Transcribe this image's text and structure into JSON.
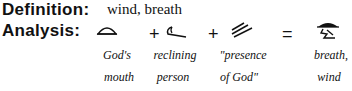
{
  "definition": {
    "label": "Definition:",
    "value": "wind, breath"
  },
  "analysis": {
    "label": "Analysis:",
    "operators": [
      "+",
      "+",
      "="
    ],
    "glyphs": [
      {
        "icon": "mouth-glyph-icon",
        "caption1": "God's",
        "caption2": "mouth"
      },
      {
        "icon": "reclining-person-glyph-icon",
        "caption1": "reclining",
        "caption2": "person"
      },
      {
        "icon": "triple-lines-glyph-icon",
        "caption1": "\"presence",
        "caption2": "of God\""
      },
      {
        "icon": "breath-wind-glyph-icon",
        "caption1": "breath,",
        "caption2": "wind"
      }
    ]
  }
}
